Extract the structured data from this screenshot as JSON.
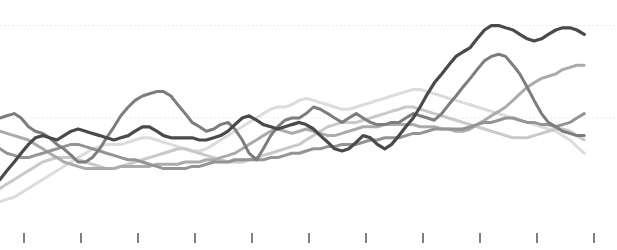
{
  "chart_data": {
    "type": "line",
    "title": "",
    "subtitle": "",
    "xlabel": "",
    "ylabel": "",
    "grid": true,
    "legend_position": "none",
    "xlim": [
      0,
      10
    ],
    "ylim": [
      0,
      100
    ],
    "axis": {
      "x_tick_positions": [
        0,
        1,
        2,
        3,
        4,
        5,
        6,
        7,
        8,
        9,
        10
      ],
      "x_tick_labels": [
        "",
        "",
        "",
        "",
        "",
        "",
        "",
        "",
        "",
        "",
        ""
      ],
      "y_gridline_values": [
        92,
        50
      ],
      "y_tick_labels": []
    },
    "colors": {
      "series_1": "#4a4a4a",
      "series_2": "#7d7d7d",
      "series_3": "#949494",
      "series_4": "#ababab",
      "series_5": "#c9c9c9",
      "series_6": "#dcdcdc",
      "gridline": "#e8e4ea",
      "tick": "#4a4a4a",
      "background": "#ffffff"
    },
    "x": [
      0.0,
      0.12,
      0.25,
      0.37,
      0.5,
      0.62,
      0.75,
      0.87,
      1.0,
      1.12,
      1.25,
      1.37,
      1.5,
      1.62,
      1.75,
      1.87,
      2.0,
      2.12,
      2.25,
      2.37,
      2.5,
      2.62,
      2.75,
      2.87,
      3.0,
      3.12,
      3.25,
      3.37,
      3.5,
      3.62,
      3.75,
      3.87,
      4.0,
      4.12,
      4.25,
      4.37,
      4.5,
      4.62,
      4.75,
      4.87,
      5.0,
      5.12,
      5.25,
      5.37,
      5.5,
      5.62,
      5.75,
      5.87,
      6.0,
      6.12,
      6.25,
      6.37,
      6.5,
      6.62,
      6.75,
      6.87,
      7.0,
      7.12,
      7.25,
      7.37,
      7.5,
      7.62,
      7.75,
      7.87,
      8.0,
      8.12,
      8.25,
      8.37,
      8.5,
      8.62,
      8.75,
      8.87,
      9.0,
      9.12,
      9.25,
      9.37,
      9.5,
      9.62,
      9.75,
      9.87,
      10.0,
      10.12,
      10.25
    ],
    "series": [
      {
        "name": "series_1",
        "color": "#4a4a4a",
        "values": [
          22,
          26,
          30,
          34,
          38,
          41,
          42,
          41,
          40,
          42,
          44,
          45,
          44,
          43,
          42,
          41,
          40,
          41,
          42,
          44,
          46,
          46,
          44,
          42,
          41,
          41,
          41,
          41,
          40,
          40,
          41,
          42,
          44,
          47,
          50,
          51,
          49,
          47,
          46,
          45,
          46,
          47,
          48,
          47,
          45,
          42,
          39,
          36,
          35,
          36,
          39,
          42,
          41,
          38,
          36,
          38,
          42,
          46,
          50,
          55,
          61,
          66,
          70,
          74,
          78,
          80,
          82,
          86,
          90,
          92,
          92,
          91,
          90,
          88,
          86,
          85,
          86,
          88,
          90,
          91,
          91,
          90,
          88
        ]
      },
      {
        "name": "series_2",
        "color": "#7d7d7d",
        "values": [
          50,
          51,
          52,
          50,
          46,
          44,
          43,
          41,
          38,
          36,
          33,
          30,
          30,
          32,
          36,
          41,
          46,
          51,
          55,
          58,
          60,
          61,
          62,
          62,
          60,
          56,
          52,
          48,
          46,
          44,
          45,
          47,
          48,
          45,
          40,
          34,
          31,
          36,
          42,
          46,
          49,
          50,
          50,
          52,
          55,
          54,
          52,
          50,
          48,
          50,
          52,
          50,
          48,
          47,
          47,
          48,
          48,
          50,
          52,
          51,
          50,
          49,
          52,
          56,
          60,
          64,
          68,
          72,
          76,
          78,
          79,
          78,
          74,
          70,
          64,
          58,
          52,
          48,
          46,
          44,
          43,
          42,
          42
        ]
      },
      {
        "name": "series_3",
        "color": "#949494",
        "values": [
          36,
          34,
          33,
          32,
          32,
          33,
          34,
          35,
          36,
          37,
          38,
          38,
          37,
          36,
          35,
          34,
          33,
          32,
          31,
          31,
          30,
          29,
          28,
          27,
          27,
          27,
          27,
          28,
          28,
          29,
          30,
          30,
          30,
          31,
          31,
          31,
          31,
          31,
          32,
          32,
          33,
          34,
          34,
          35,
          36,
          36,
          37,
          37,
          38,
          38,
          38,
          39,
          40,
          40,
          41,
          41,
          41,
          42,
          43,
          43,
          44,
          45,
          45,
          45,
          45,
          45,
          46,
          47,
          48,
          48,
          49,
          50,
          50,
          49,
          48,
          48,
          47,
          47,
          46,
          47,
          48,
          50,
          52
        ]
      },
      {
        "name": "series_4",
        "color": "#ababab",
        "values": [
          44,
          43,
          42,
          41,
          40,
          38,
          36,
          34,
          32,
          30,
          29,
          28,
          27,
          27,
          27,
          27,
          27,
          28,
          28,
          28,
          28,
          28,
          29,
          29,
          29,
          29,
          30,
          30,
          30,
          31,
          31,
          32,
          33,
          34,
          36,
          38,
          40,
          42,
          44,
          45,
          44,
          43,
          44,
          45,
          44,
          43,
          42,
          42,
          43,
          44,
          45,
          46,
          46,
          46,
          47,
          47,
          47,
          47,
          47,
          46,
          46,
          46,
          45,
          45,
          44,
          44,
          45,
          47,
          49,
          51,
          53,
          55,
          58,
          61,
          64,
          66,
          68,
          69,
          70,
          72,
          73,
          74,
          74
        ]
      },
      {
        "name": "series_5",
        "color": "#c9c9c9",
        "values": [
          18,
          20,
          22,
          24,
          26,
          28,
          30,
          31,
          32,
          32,
          32,
          31,
          30,
          29,
          28,
          27,
          27,
          28,
          29,
          30,
          31,
          32,
          33,
          34,
          35,
          36,
          36,
          35,
          34,
          33,
          32,
          31,
          30,
          30,
          30,
          31,
          32,
          33,
          34,
          35,
          36,
          37,
          38,
          40,
          42,
          44,
          46,
          47,
          48,
          48,
          48,
          49,
          50,
          51,
          52,
          53,
          54,
          55,
          55,
          54,
          53,
          52,
          51,
          50,
          49,
          48,
          47,
          46,
          45,
          44,
          43,
          42,
          41,
          41,
          41,
          42,
          43,
          44,
          45,
          45,
          44,
          42,
          40
        ]
      },
      {
        "name": "series_6",
        "color": "#dcdcdc",
        "values": [
          12,
          13,
          14,
          16,
          18,
          20,
          22,
          24,
          26,
          28,
          30,
          32,
          34,
          36,
          37,
          38,
          38,
          38,
          39,
          40,
          41,
          41,
          40,
          39,
          38,
          37,
          36,
          35,
          35,
          36,
          38,
          40,
          42,
          44,
          46,
          48,
          50,
          52,
          54,
          55,
          55,
          56,
          58,
          59,
          58,
          57,
          56,
          55,
          54,
          54,
          55,
          56,
          57,
          58,
          59,
          60,
          61,
          62,
          63,
          63,
          62,
          61,
          60,
          59,
          58,
          57,
          56,
          55,
          54,
          53,
          52,
          51,
          50,
          49,
          48,
          47,
          46,
          45,
          44,
          42,
          40,
          37,
          34
        ]
      }
    ]
  }
}
